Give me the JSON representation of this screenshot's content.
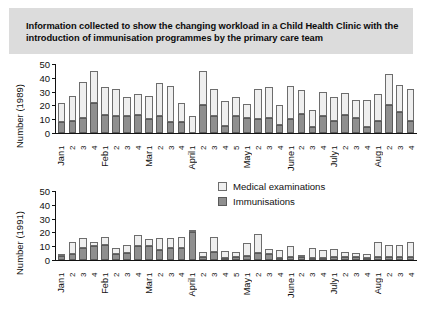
{
  "title": "Information collected to show the changing workload in a Child Health Clinic with the introduction of immunisation programmes by the primary care team",
  "legend": {
    "medical": "Medical examinations",
    "immunisations": "Immunisations"
  },
  "colors": {
    "medical": "#efefef",
    "immunisations": "#8f8f8f",
    "title_band": "#dcdcdc",
    "axis": "#111111"
  },
  "chart_data": [
    {
      "type": "bar",
      "stacked": true,
      "title": "",
      "xlabel": "",
      "ylabel": "Number (1989)",
      "ylim": [
        0,
        50
      ],
      "yticks": [
        0,
        10,
        20,
        30,
        40,
        50
      ],
      "grid": false,
      "legend_position": "center-right",
      "categories": [
        "Jan 1",
        "Jan 2",
        "Jan 3",
        "Jan 4",
        "Feb 1",
        "Feb 2",
        "Feb 3",
        "Feb 4",
        "Mar 1",
        "Mar 2",
        "Mar 3",
        "Mar 4",
        "April 1",
        "April 2",
        "April 3",
        "April 4",
        "April 5",
        "May 1",
        "May 2",
        "May 3",
        "May 4",
        "June 1",
        "June 2",
        "June 3",
        "June 4",
        "July 1",
        "July 2",
        "July 3",
        "July 4",
        "Aug 1",
        "Aug 2",
        "Aug 3",
        "Aug 4"
      ],
      "month_groups": [
        {
          "label": "Jan",
          "weeks": [
            "1",
            "2",
            "3",
            "4"
          ]
        },
        {
          "label": "Feb",
          "weeks": [
            "1",
            "2",
            "3",
            "4"
          ]
        },
        {
          "label": "Mar",
          "weeks": [
            "1",
            "2",
            "3",
            "4"
          ]
        },
        {
          "label": "April",
          "weeks": [
            "1",
            "2",
            "3",
            "4",
            "5"
          ]
        },
        {
          "label": "May",
          "weeks": [
            "1",
            "2",
            "3",
            "4"
          ]
        },
        {
          "label": "June",
          "weeks": [
            "1",
            "2",
            "3",
            "4"
          ]
        },
        {
          "label": "July",
          "weeks": [
            "1",
            "2",
            "3",
            "4"
          ]
        },
        {
          "label": "Aug",
          "weeks": [
            "1",
            "2",
            "3",
            "4"
          ]
        }
      ],
      "series": [
        {
          "name": "Immunisations",
          "values": [
            8,
            9,
            11,
            22,
            13,
            12,
            12,
            13,
            10,
            12,
            8,
            8,
            0,
            20,
            12,
            5,
            12,
            11,
            10,
            11,
            6,
            10,
            14,
            4,
            12,
            9,
            13,
            11,
            4,
            9,
            20,
            15,
            9
          ]
        },
        {
          "name": "Medical examinations",
          "values": [
            14,
            18,
            26,
            23,
            20,
            20,
            14,
            15,
            17,
            24,
            26,
            14,
            12,
            25,
            20,
            18,
            14,
            10,
            22,
            22,
            14,
            24,
            17,
            13,
            18,
            17,
            16,
            13,
            20,
            19,
            23,
            20,
            23
          ]
        }
      ],
      "totals": [
        22,
        27,
        37,
        45,
        33,
        32,
        26,
        28,
        27,
        36,
        34,
        22,
        12,
        45,
        32,
        23,
        26,
        21,
        32,
        33,
        20,
        34,
        31,
        17,
        30,
        26,
        29,
        24,
        24,
        28,
        43,
        35,
        32
      ]
    },
    {
      "type": "bar",
      "stacked": true,
      "title": "",
      "xlabel": "",
      "ylabel": "Number (1991)",
      "ylim": [
        0,
        50
      ],
      "yticks": [
        0,
        10,
        20,
        30,
        40,
        50
      ],
      "grid": false,
      "categories": [
        "Jan 1",
        "Jan 2",
        "Jan 3",
        "Jan 4",
        "Feb 1",
        "Feb 2",
        "Feb 3",
        "Feb 4",
        "Mar 1",
        "Mar 2",
        "Mar 3",
        "Mar 4",
        "April 1",
        "April 2",
        "April 3",
        "April 4",
        "April 5",
        "May 1",
        "May 2",
        "May 3",
        "May 4",
        "June 1",
        "June 2",
        "June 3",
        "June 4",
        "July 1",
        "July 2",
        "July 3",
        "July 4",
        "Aug 1",
        "Aug 2",
        "Aug 3",
        "Aug 4"
      ],
      "month_groups": [
        {
          "label": "Jan",
          "weeks": [
            "1",
            "2",
            "3",
            "4"
          ]
        },
        {
          "label": "Feb",
          "weeks": [
            "1",
            "2",
            "3",
            "4"
          ]
        },
        {
          "label": "Mar",
          "weeks": [
            "1",
            "2",
            "3",
            "4"
          ]
        },
        {
          "label": "April",
          "weeks": [
            "1",
            "2",
            "3",
            "4",
            "5"
          ]
        },
        {
          "label": "May",
          "weeks": [
            "1",
            "2",
            "3",
            "4"
          ]
        },
        {
          "label": "June",
          "weeks": [
            "1",
            "2",
            "3",
            "4"
          ]
        },
        {
          "label": "July",
          "weeks": [
            "1",
            "2",
            "3",
            "4"
          ]
        },
        {
          "label": "Aug",
          "weeks": [
            "1",
            "2",
            "3",
            "4"
          ]
        }
      ],
      "series": [
        {
          "name": "Immunisations",
          "values": [
            3,
            4,
            9,
            10,
            11,
            4,
            5,
            10,
            10,
            7,
            9,
            9,
            20,
            2,
            6,
            1,
            2,
            3,
            5,
            4,
            1,
            2,
            2,
            1,
            1,
            2,
            2,
            2,
            1,
            2,
            2,
            2,
            2
          ]
        },
        {
          "name": "Medical examinations",
          "values": [
            1,
            9,
            7,
            3,
            6,
            5,
            6,
            8,
            5,
            9,
            7,
            8,
            2,
            4,
            11,
            5,
            4,
            9,
            14,
            4,
            6,
            8,
            1,
            7,
            6,
            6,
            4,
            3,
            3,
            11,
            9,
            9,
            11
          ]
        }
      ],
      "totals": [
        4,
        13,
        16,
        13,
        17,
        9,
        11,
        18,
        15,
        16,
        16,
        17,
        22,
        6,
        17,
        6,
        6,
        12,
        19,
        8,
        7,
        10,
        3,
        8,
        7,
        8,
        6,
        5,
        4,
        13,
        11,
        11,
        13
      ]
    }
  ]
}
